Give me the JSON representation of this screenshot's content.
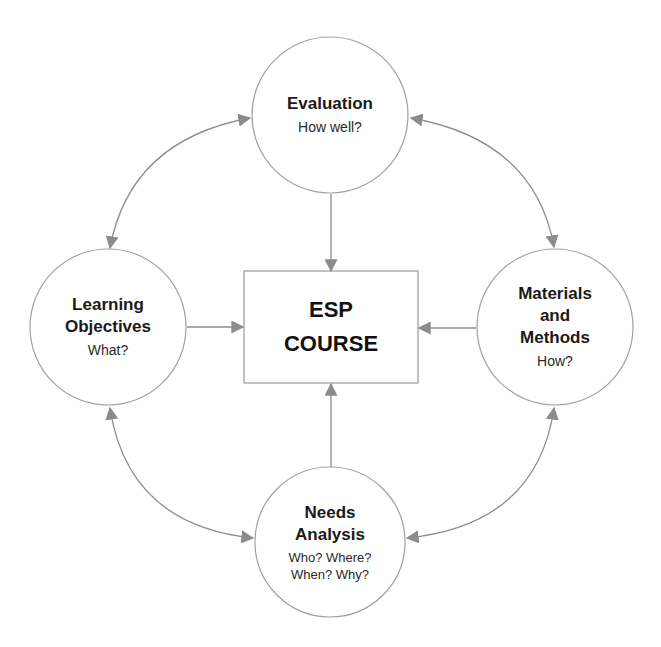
{
  "diagram": {
    "colors": {
      "stroke": "#9a9a9a",
      "arrow": "#8c8c8c",
      "text": "#1a1a1a",
      "background": "#ffffff"
    },
    "center": {
      "line1": "ESP",
      "line2": "COURSE"
    },
    "nodes": {
      "evaluation": {
        "title": "Evaluation",
        "subtitle": "How well?"
      },
      "learning_objectives": {
        "title_line1": "Learning",
        "title_line2": "Objectives",
        "subtitle": "What?"
      },
      "materials_methods": {
        "title_line1": "Materials",
        "title_line2": "and",
        "title_line3": "Methods",
        "subtitle": "How?"
      },
      "needs_analysis": {
        "title_line1": "Needs",
        "title_line2": "Analysis",
        "subtitle_line1": "Who? Where?",
        "subtitle_line2": "When? Why?"
      }
    },
    "connections": [
      {
        "from": "evaluation",
        "to": "esp_course",
        "type": "one-way"
      },
      {
        "from": "learning_objectives",
        "to": "esp_course",
        "type": "one-way"
      },
      {
        "from": "materials_methods",
        "to": "esp_course",
        "type": "one-way"
      },
      {
        "from": "needs_analysis",
        "to": "esp_course",
        "type": "one-way"
      },
      {
        "from": "evaluation",
        "to": "learning_objectives",
        "type": "two-way"
      },
      {
        "from": "evaluation",
        "to": "materials_methods",
        "type": "two-way"
      },
      {
        "from": "learning_objectives",
        "to": "needs_analysis",
        "type": "two-way"
      },
      {
        "from": "materials_methods",
        "to": "needs_analysis",
        "type": "two-way"
      }
    ]
  }
}
